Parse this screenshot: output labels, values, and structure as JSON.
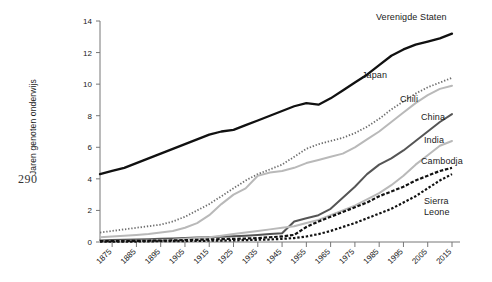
{
  "page": {
    "number": "290"
  },
  "chart_data": {
    "type": "line",
    "title": "",
    "xlabel": "",
    "ylabel": "Jaren genoten onderwijs",
    "xlim": [
      1870,
      2015
    ],
    "ylim": [
      0,
      14
    ],
    "grid": false,
    "legend_position": "inline-right-of-line-end",
    "yticks": [
      "0",
      "2",
      "4",
      "6",
      "8",
      "10",
      "12",
      "14"
    ],
    "ytick_values": [
      0,
      2,
      4,
      6,
      8,
      10,
      12,
      14
    ],
    "xticks": [
      "1875",
      "1885",
      "1895",
      "1905",
      "1915",
      "1925",
      "1935",
      "1945",
      "1955",
      "1965",
      "1975",
      "1985",
      "1995",
      "2005",
      "2015"
    ],
    "xtick_values": [
      1875,
      1885,
      1895,
      1905,
      1915,
      1925,
      1935,
      1945,
      1955,
      1965,
      1975,
      1985,
      1995,
      2005,
      2015
    ],
    "x": [
      1870,
      1875,
      1880,
      1885,
      1890,
      1895,
      1900,
      1905,
      1910,
      1915,
      1920,
      1925,
      1930,
      1935,
      1940,
      1945,
      1950,
      1955,
      1960,
      1965,
      1970,
      1975,
      1980,
      1985,
      1990,
      1995,
      2000,
      2005,
      2010,
      2015
    ],
    "series": [
      {
        "name": "Verenigde Staten",
        "color": "#111111",
        "style": "solid",
        "width": 2.3,
        "label_x": 376,
        "label_y": 12,
        "values": [
          4.3,
          4.5,
          4.7,
          5.0,
          5.3,
          5.6,
          5.9,
          6.2,
          6.5,
          6.8,
          7.0,
          7.1,
          7.4,
          7.7,
          8.0,
          8.3,
          8.6,
          8.8,
          8.7,
          9.1,
          9.6,
          10.1,
          10.6,
          11.2,
          11.8,
          12.2,
          12.5,
          12.7,
          12.9,
          13.2
        ]
      },
      {
        "name": "Japan",
        "color": "#6e6e6e",
        "style": "dotted",
        "width": 1.8,
        "label_x": 362,
        "label_y": 70,
        "values": [
          0.6,
          0.7,
          0.8,
          0.9,
          1.0,
          1.1,
          1.3,
          1.6,
          2.0,
          2.4,
          2.9,
          3.4,
          3.9,
          4.3,
          4.6,
          4.9,
          5.4,
          5.9,
          6.2,
          6.4,
          6.6,
          6.9,
          7.3,
          7.8,
          8.4,
          8.9,
          9.4,
          9.8,
          10.1,
          10.4
        ]
      },
      {
        "name": "Chili",
        "color": "#b9b9b9",
        "style": "solid",
        "width": 2.0,
        "label_x": 400,
        "label_y": 94,
        "values": [
          0.3,
          0.35,
          0.4,
          0.45,
          0.5,
          0.6,
          0.7,
          0.9,
          1.2,
          1.7,
          2.4,
          3.0,
          3.4,
          4.2,
          4.4,
          4.5,
          4.7,
          5.0,
          5.2,
          5.4,
          5.6,
          6.0,
          6.5,
          7.0,
          7.6,
          8.2,
          8.8,
          9.3,
          9.7,
          9.9
        ]
      },
      {
        "name": "China",
        "color": "#555555",
        "style": "solid",
        "width": 2.0,
        "label_x": 421,
        "label_y": 112,
        "values": [
          0.1,
          0.12,
          0.14,
          0.16,
          0.18,
          0.2,
          0.22,
          0.25,
          0.28,
          0.3,
          0.33,
          0.36,
          0.4,
          0.45,
          0.5,
          0.55,
          1.3,
          1.5,
          1.7,
          2.1,
          2.8,
          3.5,
          4.3,
          4.9,
          5.3,
          5.8,
          6.4,
          7.0,
          7.6,
          8.1
        ]
      },
      {
        "name": "India",
        "color": "#b9b9b9",
        "style": "solid",
        "width": 2.0,
        "label_x": 424,
        "label_y": 135,
        "values": [
          0.05,
          0.06,
          0.07,
          0.08,
          0.1,
          0.12,
          0.15,
          0.2,
          0.25,
          0.3,
          0.4,
          0.5,
          0.6,
          0.7,
          0.8,
          0.9,
          1.0,
          1.2,
          1.4,
          1.7,
          2.0,
          2.3,
          2.7,
          3.1,
          3.6,
          4.2,
          4.9,
          5.5,
          6.1,
          6.4
        ]
      },
      {
        "name": "Cambodja",
        "color": "#111111",
        "style": "dashed",
        "width": 2.2,
        "label_x": 421,
        "label_y": 156,
        "values": [
          0.05,
          0.05,
          0.06,
          0.07,
          0.08,
          0.09,
          0.1,
          0.12,
          0.14,
          0.16,
          0.18,
          0.2,
          0.22,
          0.25,
          0.3,
          0.35,
          0.45,
          0.95,
          1.3,
          1.6,
          1.9,
          2.2,
          2.5,
          2.9,
          3.2,
          3.5,
          3.9,
          4.2,
          4.5,
          4.7
        ]
      },
      {
        "name": "Sierra Leone",
        "color": "#111111",
        "style": "dotted-heavy",
        "width": 2.2,
        "label_x": 424,
        "label_y": 196,
        "values": [
          0.02,
          0.02,
          0.03,
          0.03,
          0.04,
          0.05,
          0.05,
          0.06,
          0.07,
          0.08,
          0.09,
          0.1,
          0.12,
          0.14,
          0.16,
          0.2,
          0.25,
          0.35,
          0.5,
          0.7,
          0.95,
          1.2,
          1.5,
          1.8,
          2.1,
          2.5,
          2.9,
          3.4,
          3.9,
          4.3
        ]
      }
    ]
  }
}
